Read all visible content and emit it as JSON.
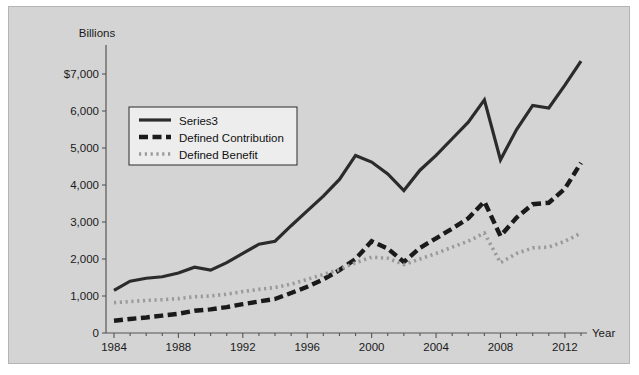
{
  "chart": {
    "unit_label": "Billions",
    "xaxis_name": "Year",
    "background_color": "#d4d4d4",
    "frame_color": "#b4b4b4"
  },
  "chart_data": {
    "type": "line",
    "title": "",
    "subtitle": "",
    "xlabel": "Year",
    "ylabel": "Billions",
    "grid": false,
    "legend_position": "top-left",
    "xlim": [
      1984,
      2013
    ],
    "ylim": [
      0,
      7500
    ],
    "ytick_labels": [
      "0",
      "1,000",
      "2,000",
      "3,000",
      "4,000",
      "5,000",
      "6,000",
      "$7,000"
    ],
    "ytick_values": [
      0,
      1000,
      2000,
      3000,
      4000,
      5000,
      6000,
      7000
    ],
    "xtick_labels": [
      "1984",
      "1988",
      "1992",
      "1996",
      "2000",
      "2004",
      "2008",
      "2012"
    ],
    "xtick_values": [
      1984,
      1988,
      1992,
      1996,
      2000,
      2004,
      2008,
      2012
    ],
    "x": [
      1984,
      1985,
      1986,
      1987,
      1988,
      1989,
      1990,
      1991,
      1992,
      1993,
      1994,
      1995,
      1996,
      1997,
      1998,
      1999,
      2000,
      2001,
      2002,
      2003,
      2004,
      2005,
      2006,
      2007,
      2008,
      2009,
      2010,
      2011,
      2012,
      2013
    ],
    "series": [
      {
        "name": "Series3",
        "style": "solid",
        "color": "#2b2b2b",
        "values": [
          1150,
          1400,
          1480,
          1520,
          1620,
          1780,
          1700,
          1900,
          2150,
          2400,
          2480,
          2900,
          3300,
          3700,
          4150,
          4800,
          4620,
          4300,
          3850,
          4400,
          4800,
          5250,
          5700,
          6300,
          4680,
          5500,
          6150,
          6080,
          6700,
          7350
        ]
      },
      {
        "name": "Defined Contribution",
        "style": "dashed",
        "color": "#1a1a1a",
        "values": [
          330,
          380,
          420,
          470,
          520,
          600,
          640,
          700,
          780,
          850,
          920,
          1080,
          1250,
          1450,
          1700,
          2000,
          2480,
          2280,
          1920,
          2300,
          2560,
          2820,
          3100,
          3550,
          2620,
          3120,
          3480,
          3520,
          3900,
          4600
        ]
      },
      {
        "name": "Defined Benefit",
        "style": "dotted",
        "color": "#9a9a9a",
        "values": [
          820,
          850,
          880,
          900,
          930,
          980,
          1000,
          1050,
          1120,
          1180,
          1230,
          1320,
          1450,
          1580,
          1720,
          1900,
          2050,
          2020,
          1850,
          2000,
          2150,
          2320,
          2480,
          2700,
          1900,
          2150,
          2300,
          2320,
          2480,
          2700
        ]
      }
    ]
  },
  "legend": {
    "items": [
      {
        "label": "Series3"
      },
      {
        "label": "Defined Contribution"
      },
      {
        "label": "Defined Benefit"
      }
    ]
  }
}
